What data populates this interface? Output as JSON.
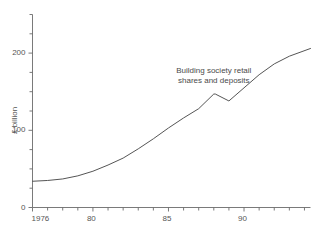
{
  "chart_data": {
    "type": "line",
    "title": "",
    "subtitle": "",
    "xlabel": "",
    "ylabel": "£ billion",
    "xlim": [
      1976,
      1994.4
    ],
    "ylim": [
      0,
      250
    ],
    "grid": false,
    "legend_position": "inline-annotation",
    "annotations": [
      {
        "text": "Building society retail\nshares and deposits",
        "x": 1988.0,
        "y": 175
      }
    ],
    "x_tick_labels": [
      "1976",
      "80",
      "85",
      "90"
    ],
    "x_tick_label_values": [
      1976,
      1980,
      1985,
      1990
    ],
    "x_minor_tick_values": [
      1976,
      1977,
      1978,
      1979,
      1980,
      1981,
      1982,
      1983,
      1984,
      1985,
      1986,
      1987,
      1988,
      1989,
      1990,
      1991,
      1992,
      1993,
      1994
    ],
    "y_tick_labels": [
      "0",
      "100",
      "200"
    ],
    "y_tick_label_values": [
      0,
      100,
      200
    ],
    "y_minor_tick_values": [
      0,
      25,
      50,
      75,
      100,
      125,
      150,
      175,
      200,
      225,
      250
    ],
    "series": [
      {
        "name": "Building society retail shares and deposits",
        "color": "#555555",
        "x": [
          1976,
          1977,
          1978,
          1979,
          1980,
          1981,
          1982,
          1983,
          1984,
          1985,
          1986,
          1987,
          1988,
          1988.1,
          1989,
          1990,
          1991,
          1992,
          1993,
          1994.4
        ],
        "values": [
          34,
          35,
          37,
          41,
          47,
          55,
          64,
          76,
          89,
          103,
          116,
          128,
          147,
          147,
          138,
          155,
          172,
          186,
          196,
          206
        ]
      }
    ]
  },
  "axis": {
    "y_axis_name": "y-axis",
    "x_axis_name": "x-axis"
  }
}
